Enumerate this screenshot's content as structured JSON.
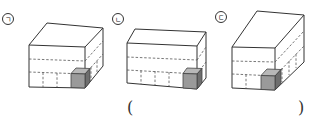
{
  "figures": [
    {
      "id": "a",
      "label": "ㄱ",
      "description": "cuboid of unit cubes, 4 wide x 3 high front face, one shaded unit cube at bottom-right front"
    },
    {
      "id": "b",
      "label": "ㄴ",
      "description": "cuboid of unit cubes, 5 wide x 3 high front face, shallow depth, one shaded unit cube at bottom-right front"
    },
    {
      "id": "c",
      "label": "ㄷ",
      "description": "cuboid of unit cubes, 3 wide x 3 high front face, deep depth, one shaded unit cube at bottom-right front"
    }
  ],
  "answer": {
    "open_paren": "(",
    "close_paren": ")",
    "value": ""
  },
  "colors": {
    "edge": "#333333",
    "shade_front": "#9a9a9a",
    "shade_top": "#b8b8b8",
    "shade_side": "#6e6e6e"
  }
}
